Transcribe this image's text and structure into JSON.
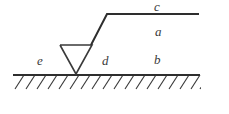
{
  "figure": {
    "kind": "physics-line-diagram",
    "background_color": "#ffffff",
    "stroke_color": "#2e2e2e",
    "label_color": "#3a3a3a",
    "labels": [
      {
        "id": "c",
        "text": "c",
        "x": 154,
        "y": 0,
        "describes": "upper horizontal segment"
      },
      {
        "id": "a",
        "text": "a",
        "x": 155,
        "y": 25,
        "describes": "region between upper segment and ground"
      },
      {
        "id": "b",
        "text": "b",
        "x": 154,
        "y": 53,
        "describes": "region just above ground, right of triangle"
      },
      {
        "id": "d",
        "text": "d",
        "x": 102,
        "y": 54,
        "describes": "region right of triangle on ground"
      },
      {
        "id": "e",
        "text": "e",
        "x": 37,
        "y": 54,
        "describes": "region left of triangle on ground"
      }
    ],
    "geometry": {
      "ground_line": {
        "x1": 13,
        "y1": 75,
        "x2": 200,
        "y2": 75
      },
      "top_horizontal": {
        "x1": 107,
        "y1": 14,
        "x2": 199,
        "y2": 14
      },
      "diagonal_riser": {
        "x1": 107,
        "y1": 14,
        "x2": 91,
        "y2": 45
      },
      "triangle": {
        "top_left": {
          "x": 60,
          "y": 45
        },
        "top_right": {
          "x": 92,
          "y": 45
        },
        "apex": {
          "x": 76,
          "y": 74
        }
      },
      "hatching": {
        "start_x": 13,
        "end_x": 200,
        "spacing": 11,
        "run": 9,
        "drop": 14,
        "baseline_y": 75
      }
    }
  }
}
